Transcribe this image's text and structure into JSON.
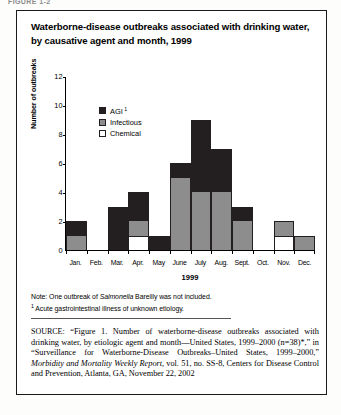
{
  "clipped_header": "FIGURE 1-2",
  "title": "Waterborne-disease outbreaks associated with drinking water, by causative agent and month, 1999",
  "axis": {
    "ylabel": "Number of outbreaks",
    "xlabel": "1999",
    "yticks": [
      "0",
      "2",
      "4",
      "6",
      "8",
      "10",
      "12"
    ]
  },
  "legend": {
    "items": [
      {
        "label": "AGI",
        "footnote_marker": "1",
        "color": "#231f20",
        "key": "agi"
      },
      {
        "label": "Infectious",
        "footnote_marker": "",
        "color": "#8d8d8d",
        "key": "infectious"
      },
      {
        "label": "Chemical",
        "footnote_marker": "",
        "color": "#ffffff",
        "key": "chemical"
      }
    ]
  },
  "notes": {
    "note_prefix": "Note: One outbreak of ",
    "note_italic": "Salmonella",
    "note_suffix": " Bareilly was not included.",
    "footnote_marker": "1",
    "footnote": " Acute gastrointestinal illness of unknown etiology."
  },
  "source": {
    "label": "SOURCE:",
    "text": " “Figure 1. Number of waterborne-disease outbreaks associated with drinking water, by etiologic agent and month—United States, 1999–2000 (n=38)*,” in “Surveillance for Waterborne-Disease Outbreaks–United States, 1999–2000,” ",
    "italic": "Morbidity and Mortality Weekly Report,",
    "tail": " vol. 51, no. SS-8, Centers for Disease Control and Prevention, Atlanta, GA, November 22, 2002"
  },
  "chart_data": {
    "type": "bar",
    "stacked": true,
    "title": "Waterborne-disease outbreaks associated with drinking water, by causative agent and month, 1999",
    "xlabel": "1999",
    "ylabel": "Number of outbreaks",
    "ylim": [
      0,
      12
    ],
    "ytick_step": 2,
    "grid": false,
    "legend_position": "inside-top-left",
    "categories": [
      "Jan.",
      "Feb.",
      "Mar.",
      "Apr.",
      "May",
      "June",
      "July",
      "Aug.",
      "Sept.",
      "Oct.",
      "Nov.",
      "Dec."
    ],
    "series": [
      {
        "name": "Chemical",
        "color": "#ffffff",
        "values": [
          0,
          0,
          0,
          1,
          0,
          0,
          0,
          0,
          0,
          0,
          1,
          0
        ]
      },
      {
        "name": "Infectious",
        "color": "#8d8d8d",
        "values": [
          1,
          0,
          0,
          1,
          0,
          5,
          4,
          4,
          2,
          0,
          1,
          1
        ]
      },
      {
        "name": "AGI",
        "color": "#231f20",
        "values": [
          1,
          0,
          3,
          2,
          1,
          1,
          5,
          3,
          1,
          0,
          0,
          0
        ]
      }
    ],
    "totals": [
      2,
      0,
      3,
      4,
      1,
      6,
      9,
      7,
      3,
      0,
      2,
      1
    ]
  }
}
